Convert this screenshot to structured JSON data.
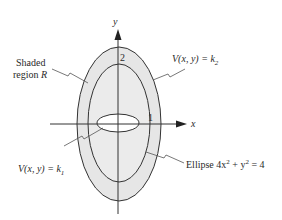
{
  "diagram": {
    "axes": {
      "x_label": "x",
      "y_label": "y"
    },
    "tick_labels": {
      "y_intercept": "2",
      "x_intercept": "1"
    },
    "annotations": {
      "shaded_region_line1": "Shaded",
      "shaded_region_line2": "region ",
      "shaded_region_symbol": "R",
      "level_curve_k2_prefix": "V(x, y) = k",
      "level_curve_k2_sub": "2",
      "level_curve_k1_prefix": "V(x, y) = k",
      "level_curve_k1_sub": "1",
      "ellipse_prefix": "Ellipse 4x",
      "ellipse_sup1": "2",
      "ellipse_mid": " + y",
      "ellipse_sup2": "2",
      "ellipse_suffix": " = 4"
    },
    "colors": {
      "shaded_fill": "#e6e6e6",
      "stroke": "#333333",
      "background": "#ffffff"
    }
  }
}
